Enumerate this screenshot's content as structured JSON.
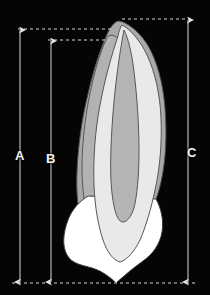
{
  "figure": {
    "background_color": "#050505",
    "width": 210,
    "height": 295
  },
  "measurements": [
    {
      "id": "A",
      "label": "A",
      "name": "total-tooth-length",
      "axis_x": 20,
      "top_y": 29,
      "bottom_y": 283,
      "top_guide": {
        "x1": 18,
        "x2": 112,
        "y": 29
      },
      "label_x": 11,
      "label_y": 149
    },
    {
      "id": "B",
      "label": "B",
      "name": "root-length",
      "axis_x": 51,
      "top_y": 40,
      "bottom_y": 283,
      "top_guide": {
        "x1": 48,
        "x2": 110,
        "y": 40
      },
      "label_x": 42,
      "label_y": 152
    },
    {
      "id": "C",
      "label": "C",
      "name": "maximum-tooth-height",
      "axis_x": 188,
      "top_y": 19,
      "bottom_y": 283,
      "top_guide": {
        "x1": 122,
        "x2": 190,
        "y": 19
      },
      "label_x": 183,
      "label_y": 146
    }
  ],
  "baseline": {
    "name": "bottom-reference-line",
    "x1": 12,
    "x2": 196,
    "y": 283
  },
  "tooth": {
    "name": "longitudinal-tooth-section",
    "layers": [
      {
        "id": "cementum",
        "label": "cementum-outer-layer",
        "fill": "#a9a9a9",
        "stroke": "#4a4a4a"
      },
      {
        "id": "enamel",
        "label": "enamel-crown",
        "fill": "#ffffff",
        "stroke": "#3c3c3c"
      },
      {
        "id": "dentin",
        "label": "dentin-body",
        "fill": "#e9e9e9",
        "stroke": "#555555"
      },
      {
        "id": "pulp",
        "label": "pulp-cavity",
        "fill": "#b4b4b4",
        "stroke": "#545454"
      }
    ]
  },
  "colors": {
    "guide_line": "#d8d8d8",
    "arrow_line": "#c6c6c6",
    "label_text": "#f2f2f2",
    "background": "#050505"
  }
}
